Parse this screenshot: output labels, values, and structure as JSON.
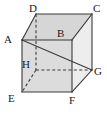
{
  "figure": {
    "shape": "cube",
    "canvas": {
      "width": 107,
      "height": 114
    },
    "colors": {
      "stroke": "#3a3a3a",
      "label": "#1a1a1a",
      "face_front": "#dcdcdc",
      "face_top": "#d6d6d6",
      "face_right": "#ededed",
      "face_left": "#cfcfcf",
      "background": "#ffffff"
    },
    "vertices": [
      {
        "name": "A",
        "x": 22,
        "y": 40,
        "label_x": 4,
        "label_y": 34,
        "hidden": false
      },
      {
        "name": "B",
        "x": 72,
        "y": 40,
        "label_x": 57,
        "label_y": 28,
        "hidden": false
      },
      {
        "name": "C",
        "x": 92,
        "y": 14,
        "label_x": 93,
        "label_y": 3,
        "hidden": false
      },
      {
        "name": "D",
        "x": 36,
        "y": 14,
        "label_x": 29,
        "label_y": 3,
        "hidden": false
      },
      {
        "name": "E",
        "x": 22,
        "y": 92,
        "label_x": 8,
        "label_y": 93,
        "hidden": false
      },
      {
        "name": "F",
        "x": 72,
        "y": 92,
        "label_x": 69,
        "label_y": 95,
        "hidden": false
      },
      {
        "name": "G",
        "x": 92,
        "y": 70,
        "label_x": 94,
        "label_y": 66,
        "hidden": false
      },
      {
        "name": "H",
        "x": 36,
        "y": 70,
        "label_x": 22,
        "label_y": 59,
        "hidden": true
      }
    ],
    "faces": [
      {
        "name": "top-face",
        "points": "22,40 36,14 92,14 72,40",
        "fill": "#d6d6d6"
      },
      {
        "name": "right-face",
        "points": "72,40 92,14 92,70 72,92",
        "fill": "#ededed"
      },
      {
        "name": "front-face",
        "points": "22,40 72,40 72,92 22,92",
        "fill": "#dcdcdc"
      }
    ],
    "edges_solid": [
      {
        "name": "edge-A-B",
        "x1": 22,
        "y1": 40,
        "x2": 72,
        "y2": 40
      },
      {
        "name": "edge-B-F",
        "x1": 72,
        "y1": 40,
        "x2": 72,
        "y2": 92
      },
      {
        "name": "edge-F-E",
        "x1": 72,
        "y1": 92,
        "x2": 22,
        "y2": 92
      },
      {
        "name": "edge-E-A",
        "x1": 22,
        "y1": 92,
        "x2": 22,
        "y2": 40
      },
      {
        "name": "edge-A-D",
        "x1": 22,
        "y1": 40,
        "x2": 36,
        "y2": 14
      },
      {
        "name": "edge-D-C",
        "x1": 36,
        "y1": 14,
        "x2": 92,
        "y2": 14
      },
      {
        "name": "edge-C-B",
        "x1": 92,
        "y1": 14,
        "x2": 72,
        "y2": 40
      },
      {
        "name": "edge-C-G",
        "x1": 92,
        "y1": 14,
        "x2": 92,
        "y2": 70
      },
      {
        "name": "edge-G-F",
        "x1": 92,
        "y1": 70,
        "x2": 72,
        "y2": 92
      },
      {
        "name": "diagonal-A-G",
        "x1": 22,
        "y1": 40,
        "x2": 92,
        "y2": 70
      }
    ],
    "edges_dashed": [
      {
        "name": "edge-D-H",
        "x1": 36,
        "y1": 14,
        "x2": 36,
        "y2": 70
      },
      {
        "name": "edge-H-G",
        "x1": 36,
        "y1": 70,
        "x2": 92,
        "y2": 70
      },
      {
        "name": "edge-H-E",
        "x1": 36,
        "y1": 70,
        "x2": 22,
        "y2": 92
      }
    ]
  }
}
